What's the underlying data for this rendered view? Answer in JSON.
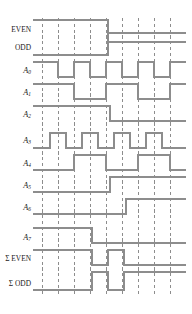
{
  "figure": {
    "type": "digital-timing-diagram",
    "title": "",
    "background_color": "#ffffff",
    "wave_color": "#8d8d8d",
    "grid_color": "#8d8d8d",
    "label_color": "#1a1a1a",
    "time_axis": {
      "x_start": 33,
      "x_end": 186,
      "gridline_x": [
        42,
        58,
        74,
        90,
        106,
        122,
        138,
        154,
        170
      ],
      "gridline_style": "dashed"
    },
    "rows": [
      {
        "label": "EVEN",
        "label_style": "upright",
        "y_high": 20,
        "y_low": 42,
        "initial_level": "high",
        "transitions": [
          108
        ],
        "row_index": 0
      },
      {
        "label": "ODD",
        "label_style": "upright",
        "y_high": 33,
        "y_low": 55,
        "initial_level": "low",
        "transitions": [
          108
        ],
        "row_index": 1
      },
      {
        "label": "A",
        "subscript": "0",
        "label_style": "italic",
        "y_high": 62,
        "y_low": 77,
        "initial_level": "high",
        "transitions": [
          58,
          74,
          90,
          106,
          122,
          138,
          154,
          170
        ],
        "row_index": 2
      },
      {
        "label": "A",
        "subscript": "1",
        "label_style": "italic",
        "y_high": 84,
        "y_low": 99,
        "initial_level": "high",
        "transitions": [
          74,
          106,
          138,
          170
        ],
        "row_index": 3
      },
      {
        "label": "A",
        "subscript": "2",
        "label_style": "italic",
        "y_high": 106,
        "y_low": 121,
        "initial_level": "high",
        "transitions": [
          110
        ],
        "row_index": 4
      },
      {
        "label": "A",
        "subscript": "3",
        "label_style": "italic",
        "y_high": 133,
        "y_low": 148,
        "initial_level": "low",
        "transitions": [
          50,
          66,
          82,
          98,
          114,
          130,
          146,
          162
        ],
        "row_index": 5
      },
      {
        "label": "A",
        "subscript": "4",
        "label_style": "italic",
        "y_high": 155,
        "y_low": 170,
        "initial_level": "low",
        "transitions": [
          74,
          106,
          138,
          170
        ],
        "row_index": 6
      },
      {
        "label": "A",
        "subscript": "5",
        "label_style": "italic",
        "y_high": 177,
        "y_low": 192,
        "initial_level": "low",
        "transitions": [
          110
        ],
        "row_index": 7
      },
      {
        "label": "A",
        "subscript": "6",
        "label_style": "italic",
        "y_high": 199,
        "y_low": 214,
        "initial_level": "low",
        "transitions": [
          126
        ],
        "row_index": 8
      },
      {
        "label": "A",
        "subscript": "7",
        "label_style": "italic",
        "y_high": 228,
        "y_low": 243,
        "initial_level": "high",
        "transitions": [
          92
        ],
        "row_index": 9
      },
      {
        "label": "Σ EVEN",
        "label_style": "upright",
        "y_high": 250,
        "y_low": 265,
        "initial_level": "high",
        "transitions": [
          92,
          108,
          124
        ],
        "row_index": 10
      },
      {
        "label": "Σ ODD",
        "label_style": "upright",
        "y_high": 272,
        "y_low": 290,
        "initial_level": "low",
        "transitions": [
          92,
          108,
          124
        ],
        "row_index": 11
      }
    ],
    "labels": {
      "even": "EVEN",
      "odd": "ODD",
      "a0": "A",
      "a0_sub": "0",
      "a1": "A",
      "a1_sub": "1",
      "a2": "A",
      "a2_sub": "2",
      "a3": "A",
      "a3_sub": "3",
      "a4": "A",
      "a4_sub": "4",
      "a5": "A",
      "a5_sub": "5",
      "a6": "A",
      "a6_sub": "6",
      "a7": "A",
      "a7_sub": "7",
      "sum_even": "Σ EVEN",
      "sum_odd": "Σ ODD"
    }
  }
}
